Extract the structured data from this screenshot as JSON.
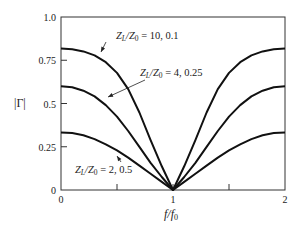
{
  "chart_data": {
    "type": "line",
    "title": "",
    "xlabel": "f/f0",
    "ylabel": "|Γ|",
    "xlim": [
      0,
      2
    ],
    "ylim": [
      0,
      1.0
    ],
    "grid": false,
    "legend_position": "inline annotations with arrows",
    "x_ticks": [
      {
        "value": 0,
        "label": "0"
      },
      {
        "value": 0.5,
        "label": ""
      },
      {
        "value": 1,
        "label": "1"
      },
      {
        "value": 1.5,
        "label": ""
      },
      {
        "value": 2,
        "label": "2"
      }
    ],
    "y_ticks": [
      {
        "value": 0,
        "label": "0"
      },
      {
        "value": 0.25,
        "label": "0.25"
      },
      {
        "value": 0.5,
        "label": "0.5"
      },
      {
        "value": 0.75,
        "label": "0.75"
      },
      {
        "value": 1.0,
        "label": "1.0"
      }
    ],
    "x": [
      0,
      0.1,
      0.2,
      0.3,
      0.4,
      0.5,
      0.6,
      0.7,
      0.8,
      0.9,
      1.0,
      1.1,
      1.2,
      1.3,
      1.4,
      1.5,
      1.6,
      1.7,
      1.8,
      1.9,
      2.0
    ],
    "series": [
      {
        "name": "ZL/Z0 = 10, 0.1",
        "annotation": {
          "main": "Z",
          "sub1": "L",
          "mid": "/Z",
          "sub2": "0",
          "tail": " = 10, 0.1"
        },
        "values": [
          0.818,
          0.814,
          0.801,
          0.778,
          0.739,
          0.677,
          0.583,
          0.448,
          0.288,
          0.137,
          0.0,
          0.137,
          0.288,
          0.448,
          0.583,
          0.677,
          0.739,
          0.778,
          0.801,
          0.814,
          0.818
        ]
      },
      {
        "name": "ZL/Z0 = 4, 0.25",
        "annotation": {
          "main": "Z",
          "sub1": "L",
          "mid": "/Z",
          "sub2": "0",
          "tail": " = 4, 0.25"
        },
        "values": [
          0.6,
          0.594,
          0.574,
          0.541,
          0.491,
          0.424,
          0.341,
          0.249,
          0.157,
          0.075,
          0.0,
          0.075,
          0.157,
          0.249,
          0.341,
          0.424,
          0.491,
          0.541,
          0.574,
          0.594,
          0.6
        ]
      },
      {
        "name": "ZL/Z0 = 2, 0.5",
        "annotation": {
          "main": "Z",
          "sub1": "L",
          "mid": "/Z",
          "sub2": "0",
          "tail": " = 2, 0.5"
        },
        "values": [
          0.333,
          0.329,
          0.316,
          0.294,
          0.264,
          0.229,
          0.187,
          0.141,
          0.094,
          0.047,
          0.0,
          0.047,
          0.094,
          0.141,
          0.187,
          0.229,
          0.264,
          0.294,
          0.316,
          0.329,
          0.333
        ]
      }
    ],
    "annotations": [
      {
        "series": 0,
        "text_x": 116,
        "text_y": 39,
        "arrow_from": [
          106,
          42
        ],
        "arrow_to": [
          101,
          52
        ]
      },
      {
        "series": 1,
        "text_x": 140,
        "text_y": 76,
        "arrow_from": [
          145,
          80
        ],
        "arrow_to": [
          108,
          97
        ]
      },
      {
        "series": 2,
        "text_x": 75,
        "text_y": 173,
        "arrow_from": [
          121,
          162
        ],
        "arrow_to": [
          117,
          156
        ]
      }
    ]
  },
  "axes": {
    "x_label_main": "f",
    "x_label_slash": "/f",
    "x_label_sub": "0",
    "y_label": "|Γ|"
  }
}
